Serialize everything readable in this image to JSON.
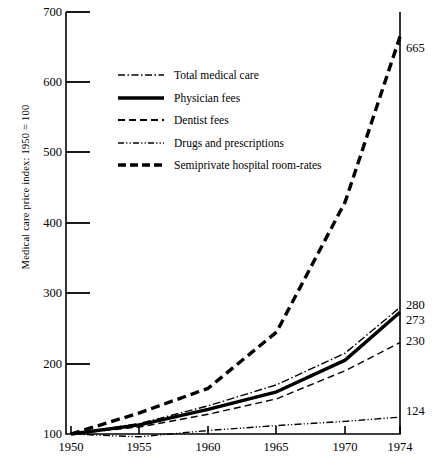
{
  "chart_data": {
    "type": "line",
    "title": "",
    "xlabel": "",
    "ylabel": "Medical care price index: 1950 = 100",
    "x": [
      1950,
      1955,
      1960,
      1965,
      1970,
      1974
    ],
    "xtick_labels": [
      "1950",
      "1955",
      "1960",
      "1965",
      "1970",
      "1974"
    ],
    "ytick_labels": [
      "100",
      "200",
      "300",
      "400",
      "500",
      "600",
      "700"
    ],
    "yticks": [
      100,
      200,
      300,
      400,
      500,
      600,
      700
    ],
    "xlim": [
      1950,
      1974
    ],
    "ylim": [
      100,
      700
    ],
    "grid": false,
    "legend_position": "upper-left-inside",
    "series": [
      {
        "name": "Total medical care",
        "style": "dash-dot",
        "width": "thin",
        "values": [
          100,
          115,
          140,
          170,
          215,
          280
        ],
        "end_label": "280"
      },
      {
        "name": "Physician fees",
        "style": "solid",
        "width": "thick",
        "values": [
          100,
          113,
          135,
          160,
          205,
          273
        ],
        "end_label": "273"
      },
      {
        "name": "Dentist fees",
        "style": "dashed",
        "width": "thin",
        "values": [
          100,
          110,
          128,
          150,
          190,
          230
        ],
        "end_label": "230"
      },
      {
        "name": "Drugs and prescriptions",
        "style": "dash-dot-dot",
        "width": "thin",
        "values": [
          100,
          96,
          105,
          112,
          118,
          124
        ],
        "end_label": "124"
      },
      {
        "name": "Semiprivate hospital room-rates",
        "style": "dashed",
        "width": "thick",
        "values": [
          100,
          130,
          165,
          245,
          430,
          665
        ],
        "end_label": "665"
      }
    ],
    "end_labels": [
      "665",
      "280",
      "273",
      "230",
      "124"
    ],
    "colors": {
      "ink": "#000000",
      "background": "#ffffff"
    }
  }
}
